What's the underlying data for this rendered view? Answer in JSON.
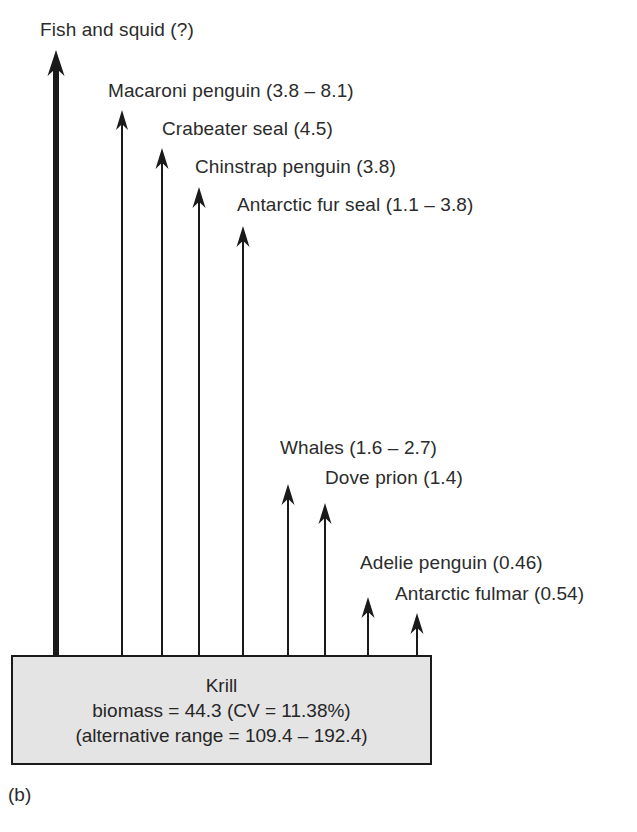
{
  "figure": {
    "panel_caption": "(b)",
    "title": "",
    "background_color": "#ffffff",
    "ink_color": "#1a1a1a",
    "box_fill_color": "#e4e4e4"
  },
  "source_box": {
    "name": "Krill",
    "lines": [
      "Krill",
      "biomass = 44.3 (CV = 11.38%)",
      "(alternative range = 109.4 – 192.4)"
    ],
    "biomass": 44.3,
    "cv_percent": 11.38,
    "alternative_range": [
      109.4,
      192.4
    ]
  },
  "chart_data": {
    "type": "diagram",
    "title": "",
    "xlabel": "",
    "ylabel": "",
    "units": "million tonnes krill consumed per year",
    "source": "Krill",
    "consumers": [
      {
        "label": "Fish and squid (?)",
        "name": "fish-and-squid",
        "value": null,
        "range": null,
        "unknown": true,
        "arrow_x": 56,
        "arrow_tip_y": 50,
        "label_x": 40,
        "label_y": 20,
        "stem_width": 6,
        "head_width": 17,
        "head_height": 26
      },
      {
        "label": "Macaroni penguin (3.8 – 8.1)",
        "name": "macaroni-penguin",
        "value": null,
        "range": [
          3.8,
          8.1
        ],
        "unknown": false,
        "arrow_x": 122,
        "arrow_tip_y": 110,
        "label_x": 108,
        "label_y": 81,
        "stem_width": 2,
        "head_width": 12,
        "head_height": 20
      },
      {
        "label": "Crabeater seal (4.5)",
        "name": "crabeater-seal",
        "value": 4.5,
        "range": null,
        "unknown": false,
        "arrow_x": 162,
        "arrow_tip_y": 148,
        "label_x": 162,
        "label_y": 119,
        "stem_width": 2,
        "head_width": 13,
        "head_height": 21
      },
      {
        "label": "Chinstrap penguin (3.8)",
        "name": "chinstrap-penguin",
        "value": 3.8,
        "range": null,
        "unknown": false,
        "arrow_x": 199,
        "arrow_tip_y": 187,
        "label_x": 195,
        "label_y": 157,
        "stem_width": 2,
        "head_width": 13,
        "head_height": 21
      },
      {
        "label": "Antarctic fur seal (1.1 – 3.8)",
        "name": "antarctic-fur-seal",
        "value": null,
        "range": [
          1.1,
          3.8
        ],
        "unknown": false,
        "arrow_x": 243,
        "arrow_tip_y": 226,
        "label_x": 237,
        "label_y": 195,
        "stem_width": 2,
        "head_width": 13,
        "head_height": 21
      },
      {
        "label": "Whales (1.6 – 2.7)",
        "name": "whales",
        "value": null,
        "range": [
          1.6,
          2.7
        ],
        "unknown": false,
        "arrow_x": 288,
        "arrow_tip_y": 484,
        "label_x": 280,
        "label_y": 438,
        "stem_width": 2,
        "head_width": 13,
        "head_height": 21
      },
      {
        "label": "Dove prion (1.4)",
        "name": "dove-prion",
        "value": 1.4,
        "range": null,
        "unknown": false,
        "arrow_x": 325,
        "arrow_tip_y": 503,
        "label_x": 325,
        "label_y": 468,
        "stem_width": 2,
        "head_width": 13,
        "head_height": 21
      },
      {
        "label": "Adelie penguin (0.46)",
        "name": "adelie-penguin",
        "value": 0.46,
        "range": null,
        "unknown": false,
        "arrow_x": 368,
        "arrow_tip_y": 597,
        "label_x": 360,
        "label_y": 553,
        "stem_width": 2,
        "head_width": 13,
        "head_height": 21
      },
      {
        "label": "Antarctic fulmar (0.54)",
        "name": "antarctic-fulmar",
        "value": 0.54,
        "range": null,
        "unknown": false,
        "arrow_x": 417,
        "arrow_tip_y": 613,
        "label_x": 395,
        "label_y": 584,
        "stem_width": 2,
        "head_width": 13,
        "head_height": 21
      }
    ]
  }
}
